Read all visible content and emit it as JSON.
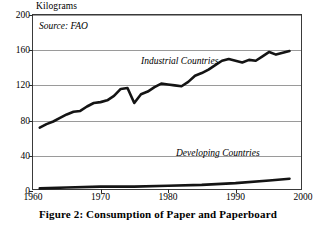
{
  "figure": {
    "caption": "Figure 2: Consumption of Paper and Paperboard",
    "y_unit_label": "Kilograms",
    "source_note": "Source: FAO"
  },
  "chart_data": {
    "type": "line",
    "title": "Figure 2: Consumption of Paper and Paperboard",
    "xlabel": "",
    "ylabel": "Kilograms",
    "xlim": [
      1960,
      2000
    ],
    "ylim": [
      0,
      200
    ],
    "xticks": [
      1960,
      1970,
      1980,
      1990,
      2000
    ],
    "yticks": [
      0,
      40,
      80,
      120,
      160,
      200
    ],
    "xtick_labels": [
      "1960",
      "1970",
      "1980",
      "1990",
      "2000"
    ],
    "ytick_labels": [
      "0",
      "40",
      "80",
      "120",
      "160",
      "200"
    ],
    "grid": "horizontal",
    "legend": "inline-annotations",
    "annotations": [
      {
        "text": "Source: FAO",
        "x": 1961,
        "y": 190
      },
      {
        "text": "Industrial Countries",
        "x": 1972,
        "y": 144
      },
      {
        "text": "Developing Countries",
        "x": 1982,
        "y": 52
      }
    ],
    "series": [
      {
        "name": "Industrial Countries",
        "x": [
          1961,
          1962,
          1963,
          1964,
          1965,
          1966,
          1967,
          1968,
          1969,
          1970,
          1971,
          1972,
          1973,
          1974,
          1975,
          1976,
          1977,
          1978,
          1979,
          1980,
          1981,
          1982,
          1983,
          1984,
          1985,
          1986,
          1987,
          1988,
          1989,
          1990,
          1991,
          1992,
          1993,
          1994,
          1995,
          1996,
          1997,
          1998
        ],
        "values": [
          72,
          76,
          79,
          83,
          87,
          90,
          91,
          96,
          100,
          101,
          103,
          108,
          116,
          117,
          100,
          110,
          113,
          118,
          122,
          121,
          120,
          119,
          124,
          131,
          134,
          138,
          143,
          148,
          150,
          148,
          146,
          149,
          148,
          153,
          158,
          155,
          157,
          159
        ]
      },
      {
        "name": "Developing Countries",
        "x": [
          1961,
          1965,
          1970,
          1975,
          1980,
          1985,
          1990,
          1995,
          1998
        ],
        "values": [
          3,
          4,
          5,
          5,
          6,
          7,
          9,
          12,
          14
        ]
      }
    ]
  }
}
